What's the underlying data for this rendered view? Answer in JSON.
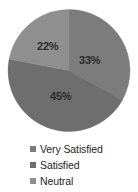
{
  "chart_data": {
    "type": "pie",
    "title": "",
    "subtitle": "",
    "xlabel": "",
    "ylabel": "",
    "grid": false,
    "legend_position": "bottom",
    "start_angle_deg": 0,
    "direction": "clockwise",
    "categories": [
      "Very Satisfied",
      "Satisfied",
      "Neutral"
    ],
    "values": [
      33,
      45,
      22
    ],
    "value_unit": "%",
    "data_labels": [
      "33%",
      "45%",
      "22%"
    ],
    "colors": [
      "#7c7c7c",
      "#6e6e6e",
      "#8f8f8f"
    ],
    "slices": [
      {
        "label": "Very Satisfied",
        "value": 33,
        "data_label": "33%",
        "color": "#7c7c7c"
      },
      {
        "label": "Satisfied",
        "value": 45,
        "data_label": "45%",
        "color": "#6e6e6e"
      },
      {
        "label": "Neutral",
        "value": 22,
        "data_label": "22%",
        "color": "#8f8f8f"
      }
    ]
  },
  "pie": {
    "label_very_satisfied": "33%",
    "label_satisfied": "45%",
    "label_neutral": "22%"
  },
  "legend": {
    "items": [
      {
        "label": "Very Satisfied",
        "color": "#7c7c7c"
      },
      {
        "label": "Satisfied",
        "color": "#6e6e6e"
      },
      {
        "label": "Neutral",
        "color": "#8f8f8f"
      }
    ]
  }
}
